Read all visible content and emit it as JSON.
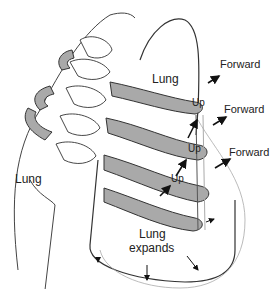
{
  "figure": {
    "labels": {
      "lung_top": "Lung",
      "lung_left": "Lung",
      "lung_expands_line1": "Lung",
      "lung_expands_line2": "expands",
      "up_1": "Up",
      "up_2": "Up",
      "up_3": "Up",
      "forward_1": "Forward",
      "forward_2": "Forward",
      "forward_3": "Forward"
    },
    "colors": {
      "rib_fill": "#a9a9a9",
      "outline": "#333333",
      "faint_line": "#999999",
      "background": "#ffffff"
    }
  }
}
